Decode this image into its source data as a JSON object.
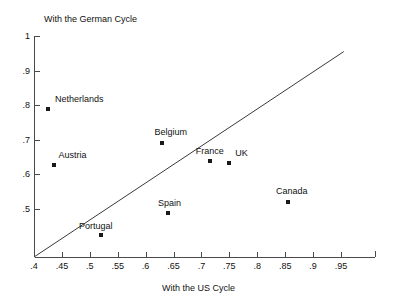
{
  "chart_data": {
    "type": "scatter",
    "title": "",
    "xlabel": "With the US Cycle",
    "ylabel": "With the German Cycle",
    "xlim": [
      0.4,
      0.97
    ],
    "ylim": [
      0.36,
      1.0
    ],
    "xticks": [
      0.4,
      0.45,
      0.5,
      0.55,
      0.6,
      0.65,
      0.7,
      0.75,
      0.8,
      0.85,
      0.9,
      0.95
    ],
    "xticklabels": [
      ".4",
      ".45",
      ".5",
      ".55",
      ".6",
      ".65",
      ".7",
      ".75",
      ".8",
      ".85",
      ".9",
      ".95"
    ],
    "yticks": [
      0.5,
      0.6,
      0.7,
      0.8,
      0.9,
      1.0
    ],
    "yticklabels": [
      ".5",
      ".6",
      ".7",
      ".8",
      ".9",
      "1"
    ],
    "grid": false,
    "legend": "none",
    "reference_line": {
      "name": "45-degree-line",
      "from": [
        0.4,
        0.4
      ],
      "to": [
        0.955,
        0.955
      ]
    },
    "points": [
      {
        "label": "Netherlands",
        "x": 0.425,
        "y": 0.79,
        "label_dx": 7,
        "label_dy": -15
      },
      {
        "label": "Austria",
        "x": 0.435,
        "y": 0.627,
        "label_dx": 5,
        "label_dy": -15
      },
      {
        "label": "Belgium",
        "x": 0.63,
        "y": 0.69,
        "label_dx": -8,
        "label_dy": -16
      },
      {
        "label": "France",
        "x": 0.715,
        "y": 0.64,
        "label_dx": -14,
        "label_dy": -15
      },
      {
        "label": "UK",
        "x": 0.75,
        "y": 0.632,
        "label_dx": 6,
        "label_dy": -15
      },
      {
        "label": "Spain",
        "x": 0.64,
        "y": 0.487,
        "label_dx": -10,
        "label_dy": -15
      },
      {
        "label": "Canada",
        "x": 0.855,
        "y": 0.52,
        "label_dx": -12,
        "label_dy": -16
      },
      {
        "label": "Portugal",
        "x": 0.52,
        "y": 0.425,
        "label_dx": -22,
        "label_dy": -14
      }
    ]
  }
}
